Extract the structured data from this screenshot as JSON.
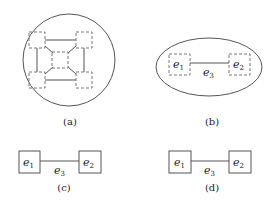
{
  "figure": {
    "panels": [
      {
        "id": "a",
        "caption": "(a)",
        "container": "circle",
        "nodes": [
          "top-left",
          "top-right",
          "bottom-left",
          "bottom-right",
          "center"
        ],
        "node_style": "dashed"
      },
      {
        "id": "b",
        "caption": "(b)",
        "container": "ellipse",
        "nodes": [
          {
            "name": "e",
            "sub": "1"
          },
          {
            "name": "e",
            "sub": "2"
          }
        ],
        "edge": {
          "name": "e",
          "sub": "3"
        },
        "node_style": "dashed"
      },
      {
        "id": "c",
        "caption": "(c)",
        "nodes": [
          {
            "name": "e",
            "sub": "1"
          },
          {
            "name": "e",
            "sub": "2"
          }
        ],
        "edge": {
          "name": "e",
          "sub": "3"
        },
        "node_style": "solid"
      },
      {
        "id": "d",
        "caption": "(d)",
        "nodes": [
          {
            "name": "e",
            "sub": "1"
          },
          {
            "name": "e",
            "sub": "2"
          }
        ],
        "edge": {
          "name": "e",
          "sub": "3"
        },
        "node_style": "solid"
      }
    ]
  }
}
